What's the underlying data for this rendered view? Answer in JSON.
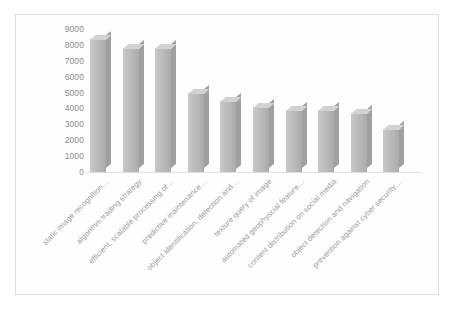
{
  "chart_data": {
    "type": "bar",
    "title": "",
    "subtitle": "",
    "xlabel": "",
    "ylabel": "",
    "grid": false,
    "legend": "none",
    "ylim": [
      0,
      9000
    ],
    "y_ticks": [
      9000,
      8000,
      7000,
      6000,
      5000,
      4000,
      3000,
      2000,
      1000,
      0
    ],
    "y_tick_labels": [
      "9000",
      "8000",
      "7000",
      "6000",
      "5000",
      "4000",
      "3000",
      "2000",
      "1000",
      "0"
    ],
    "categories": [
      "static image recognition…",
      "algorithm trading strategy",
      "efficient, scalable processing of…",
      "predictive maintenance…",
      "object identification, detection and…",
      "texture query of image",
      "automated geophyscial feature…",
      "content distribution on social media",
      "object detection and navigation",
      "prevention against cyber security…"
    ],
    "values": [
      8400,
      7800,
      7800,
      5000,
      4500,
      4100,
      3900,
      3900,
      3700,
      2700
    ],
    "bar_color": "#bdbdbd",
    "bar_top_color": "#d2d2d2",
    "bar_side_color": "#a0a0a0",
    "axis_text_color": "#8a8a8a",
    "category_text_color": "#9a9a9a",
    "frame_color": "#dcdcdc",
    "background_color": "#ffffff"
  }
}
